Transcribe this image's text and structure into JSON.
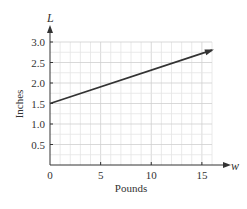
{
  "chart_data": {
    "type": "line",
    "title": "",
    "xlabel": "Pounds",
    "ylabel": "Inches",
    "x_variable": "w",
    "y_variable": "L",
    "xlim": [
      0,
      16
    ],
    "ylim": [
      0,
      3.0
    ],
    "x_ticks": [
      0,
      5,
      10,
      15
    ],
    "x_tick_labels": [
      "0",
      "5",
      "10",
      "15"
    ],
    "y_ticks": [
      0.5,
      1.0,
      1.5,
      2.0,
      2.5,
      3.0
    ],
    "y_tick_labels": [
      "0.5",
      "1.0",
      "1.5",
      "2.0",
      "2.5",
      "3.0"
    ],
    "grid": true,
    "x_grid_step": 1,
    "y_grid_step": 0.25,
    "series": [
      {
        "name": "L",
        "x": [
          0,
          16
        ],
        "y": [
          1.5,
          2.8
        ],
        "color": "#333333"
      }
    ]
  }
}
